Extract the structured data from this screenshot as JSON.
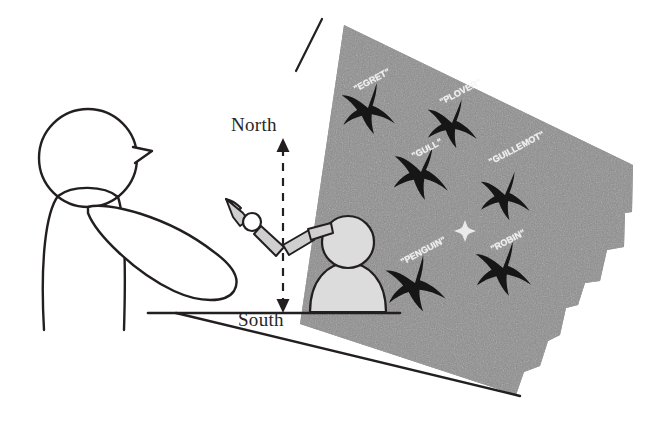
{
  "figure": {
    "type": "experiment-setup-diagram"
  },
  "direction_markers": {
    "north_label": "North",
    "south_label": "South",
    "arrow": "double-headed-vertical-dashed-arrow"
  },
  "screen": {
    "name": "projection-screen",
    "fill_color": "#8d8d8d",
    "texture": "noise-grain",
    "edge_style": "ragged-right-edge",
    "fixation_marker": "small-white-cross"
  },
  "stimuli": [
    {
      "label": "\"EGRET\"",
      "x": 352,
      "y": 85,
      "rotate": -28,
      "size": 9,
      "bird_x": 368,
      "bird_y": 108,
      "bird_scale": 1.0,
      "bird_rotate": -15
    },
    {
      "label": "\"PLOVER\"",
      "x": 438,
      "y": 98,
      "rotate": -28,
      "size": 9,
      "bird_x": 452,
      "bird_y": 123,
      "bird_scale": 0.95,
      "bird_rotate": -12
    },
    {
      "label": "\"GULL\"",
      "x": 410,
      "y": 152,
      "rotate": -28,
      "size": 9,
      "bird_x": 421,
      "bird_y": 172,
      "bird_scale": 1.05,
      "bird_rotate": -10
    },
    {
      "label": "\"GUILLEMOT\"",
      "x": 487,
      "y": 158,
      "rotate": -28,
      "size": 9,
      "bird_x": 505,
      "bird_y": 195,
      "bird_scale": 0.95,
      "bird_rotate": -12
    },
    {
      "label": "\"PENGUIN\"",
      "x": 399,
      "y": 258,
      "rotate": -28,
      "size": 9,
      "bird_x": 415,
      "bird_y": 283,
      "bird_scale": 1.1,
      "bird_rotate": -18
    },
    {
      "label": "\"ROBIN\"",
      "x": 489,
      "y": 245,
      "rotate": -28,
      "size": 9,
      "bird_x": 503,
      "bird_y": 268,
      "bird_scale": 1.05,
      "bird_rotate": -14
    }
  ],
  "actors": {
    "human": {
      "name": "human-participant",
      "style": "black-outline-stick-figure",
      "facing": "right"
    },
    "assistant": {
      "name": "seated-figure",
      "style": "light-gray-filled-silhouette",
      "fill_color": "#dcdcdc"
    },
    "robot_arm": {
      "name": "robot-arm",
      "style": "gray-filled-segments-with-joint",
      "fill_color": "#d0d0d0"
    }
  },
  "colors": {
    "outline": "#231f20",
    "screen_gray": "#8d8d8d",
    "figure_gray": "#dcdcdc",
    "arm_gray": "#cfcfcf",
    "text": "#262626",
    "stimulus_text": "#f2f2f2"
  }
}
